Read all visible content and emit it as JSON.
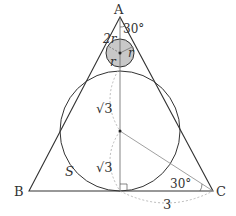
{
  "diagram": {
    "vertices": {
      "A": {
        "label": "A",
        "x": 120,
        "y": 17
      },
      "B": {
        "label": "B",
        "x": 29,
        "y": 191
      },
      "C": {
        "label": "C",
        "x": 213,
        "y": 191
      }
    },
    "small_circle": {
      "cx": 120,
      "cy": 53,
      "r": 14,
      "fill": "#c8c8c8",
      "label_radius": "r",
      "label_top": "2r"
    },
    "large_circle": {
      "cx": 120,
      "cy": 131,
      "r": 60,
      "label_region": "S"
    },
    "labels": {
      "A": "A",
      "B": "B",
      "C": "C",
      "angle_top": "30°",
      "angle_c": "30°",
      "two_r": "2r",
      "r1": "r",
      "r2": "r",
      "sqrt3_upper": "√3",
      "sqrt3_lower": "√3",
      "S": "S",
      "base_half": "3"
    },
    "colors": {
      "line": "#333333",
      "thin_line": "#888888",
      "dashed": "#aaaaaa",
      "shade": "#c8c8c8"
    }
  }
}
